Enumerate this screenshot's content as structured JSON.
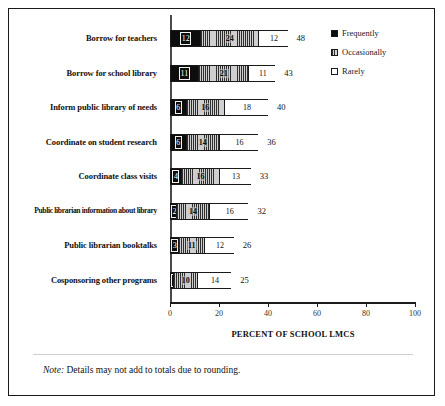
{
  "chart_data": {
    "type": "bar",
    "orientation": "horizontal",
    "stacked": true,
    "title": "",
    "xlabel": "PERCENT OF SCHOOL LMCS",
    "ylabel": "",
    "xlim": [
      0,
      100
    ],
    "xticks": [
      0,
      20,
      40,
      60,
      80,
      100
    ],
    "xticklabels": [
      "0",
      "20",
      "40",
      "60",
      "80",
      "100"
    ],
    "grid": false,
    "legend_position": "top-right",
    "categories": [
      "Borrow for teachers",
      "Borrow for school library",
      "Inform public library of needs",
      "Coordinate on student research",
      "Coordinate class visits",
      "Public librarian information about library",
      "Public librarian booktalks",
      "Cosponsoring other programs"
    ],
    "series": [
      {
        "name": "Frequently",
        "values": [
          12,
          11,
          6,
          6,
          4,
          2,
          3,
          1
        ]
      },
      {
        "name": "Occasionally",
        "values": [
          24,
          21,
          16,
          14,
          16,
          14,
          11,
          10
        ]
      },
      {
        "name": "Rarely",
        "values": [
          12,
          11,
          18,
          16,
          13,
          16,
          12,
          14
        ]
      }
    ],
    "totals": [
      48,
      43,
      40,
      36,
      33,
      32,
      26,
      25
    ],
    "colors": {
      "Frequently": "#0d0d0d",
      "Occasionally": "#9a9a9a",
      "Rarely": "#ffffff",
      "axis": "#1a1a1a",
      "border": "#1a1a1a"
    }
  },
  "legend": {
    "items": [
      {
        "label": "Frequently",
        "swatch": "solid-black-swatch"
      },
      {
        "label": "Occasionally",
        "swatch": "hatched-gray-swatch"
      },
      {
        "label": "Rarely",
        "swatch": "white-swatch"
      }
    ]
  },
  "note": {
    "word": "Note:",
    "text": " Details may not add to totals due to rounding."
  }
}
